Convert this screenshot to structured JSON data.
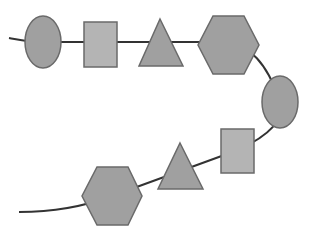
{
  "diagram": {
    "colors": {
      "line": "#333333",
      "dark_fill": "#a0a0a0",
      "light_fill": "#b4b4b4",
      "stroke": "#6a6a6a",
      "background": "#ffffff"
    },
    "connector_path": "M 9 38 C 20 40, 28 42, 40 42 L 230 42 C 250 48, 265 60, 280 100 C 285 120, 270 135, 238 150 L 112 196 C 80 208, 50 212, 19 212",
    "shapes": [
      {
        "type": "ellipse",
        "name": "ellipse-1",
        "cx": 43,
        "cy": 42,
        "rx": 18,
        "ry": 26,
        "fill": "dark"
      },
      {
        "type": "rect",
        "name": "square-1",
        "x": 84,
        "y": 22,
        "w": 33,
        "h": 45,
        "fill": "light"
      },
      {
        "type": "triangle",
        "name": "triangle-1",
        "points": "160,19 183,66 139,66",
        "fill": "dark"
      },
      {
        "type": "hexagon",
        "name": "hexagon-1",
        "points": "213,16 244,16 259,45 244,74 213,74 198,45",
        "fill": "dark"
      },
      {
        "type": "ellipse",
        "name": "ellipse-2",
        "cx": 280,
        "cy": 102,
        "rx": 18,
        "ry": 26,
        "fill": "dark"
      },
      {
        "type": "rect",
        "name": "square-2",
        "x": 221,
        "y": 129,
        "w": 33,
        "h": 44,
        "fill": "light"
      },
      {
        "type": "triangle",
        "name": "triangle-2",
        "points": "180,143 203,189 158,189",
        "fill": "dark"
      },
      {
        "type": "hexagon",
        "name": "hexagon-2",
        "points": "97,167 128,167 142,196 128,225 97,225 82,196",
        "fill": "dark"
      }
    ]
  }
}
